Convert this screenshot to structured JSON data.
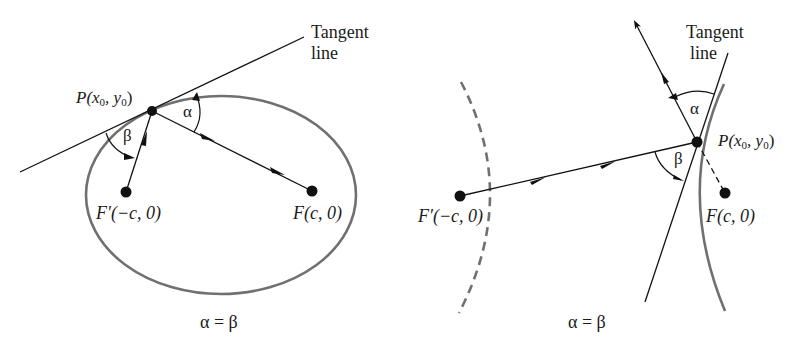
{
  "figure": {
    "left_panel": {
      "name": "ellipse-reflection",
      "tangent_label_line1": "Tangent",
      "tangent_label_line2": "line",
      "point_label_prefix": "P(x",
      "point_label_sub0": "0",
      "point_label_mid": ", y",
      "point_label_sub1": "0",
      "point_label_suffix": ")",
      "focus_left_label": "F′(−c, 0)",
      "focus_right_label": "F(c, 0)",
      "angle_alpha": "α",
      "angle_beta": "β",
      "equation": "α = β"
    },
    "right_panel": {
      "name": "hyperbola-reflection",
      "tangent_label_line1": "Tangent",
      "tangent_label_line2": "line",
      "point_label_prefix": "P(x",
      "point_label_sub0": "0",
      "point_label_mid": ", y",
      "point_label_sub1": "0",
      "point_label_suffix": ")",
      "focus_left_label": "F′(−c, 0)",
      "focus_right_label": "F(c, 0)",
      "angle_alpha": "α",
      "angle_beta": "β",
      "equation": "α = β"
    },
    "colors": {
      "ink": "#111111",
      "curve": "#707070"
    }
  }
}
